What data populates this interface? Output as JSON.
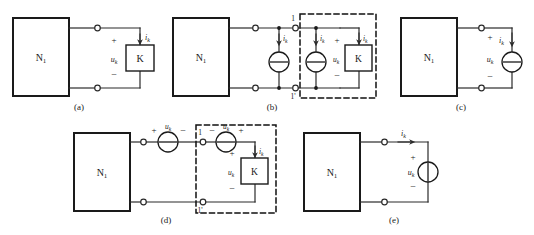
{
  "figure": {
    "network_label": "N",
    "network_sub": "1",
    "element_label": "K",
    "voltage_symbol": "u",
    "current_symbol": "i",
    "sub_k": "k",
    "plus": "+",
    "minus": "−",
    "terminal_top": "1",
    "terminal_bottom": "1'"
  },
  "captions": {
    "a": "(a)",
    "b": "(b)",
    "c": "(c)",
    "d": "(d)",
    "e": "(e)"
  },
  "colors": {
    "line": "#2b2b2b",
    "box": "#1a1a1a",
    "dashed": "#111111",
    "background": "#ffffff"
  },
  "panels": [
    {
      "id": "a",
      "caption": "(a)",
      "network": "N1",
      "elements": [
        "K-box",
        "terminal-pair",
        "voltage-u_k",
        "current-i_k"
      ],
      "sources": []
    },
    {
      "id": "b",
      "caption": "(b)",
      "network": "N1",
      "elements": [
        "K-box",
        "terminal-pair",
        "terminal-1",
        "terminal-1prime",
        "voltage-u_k",
        "dashed-boundary"
      ],
      "sources": [
        {
          "type": "current",
          "label": "i_k",
          "orientation": "vertical",
          "arrow": "down"
        },
        {
          "type": "current",
          "label": "i_k",
          "orientation": "vertical",
          "arrow": "down"
        }
      ]
    },
    {
      "id": "c",
      "caption": "(c)",
      "network": "N1",
      "elements": [
        "terminal-pair",
        "voltage-u_k",
        "current-i_k"
      ],
      "sources": [
        {
          "type": "current",
          "label": "i_k",
          "orientation": "vertical",
          "arrow": "down"
        }
      ]
    },
    {
      "id": "d",
      "caption": "(d)",
      "network": "N1",
      "elements": [
        "K-box",
        "terminal-pair",
        "terminal-1",
        "terminal-1prime",
        "voltage-u_k",
        "current-i_k",
        "dashed-boundary"
      ],
      "sources": [
        {
          "type": "voltage",
          "label": "u_k",
          "orientation": "horizontal",
          "left": "+",
          "right": "−"
        },
        {
          "type": "voltage",
          "label": "u_k",
          "orientation": "horizontal",
          "left": "−",
          "right": "+"
        }
      ]
    },
    {
      "id": "e",
      "caption": "(e)",
      "network": "N1",
      "elements": [
        "terminal-pair",
        "current-i_k"
      ],
      "sources": [
        {
          "type": "voltage",
          "label": "u_k",
          "orientation": "vertical",
          "top": "+",
          "bottom": "−"
        }
      ]
    }
  ]
}
